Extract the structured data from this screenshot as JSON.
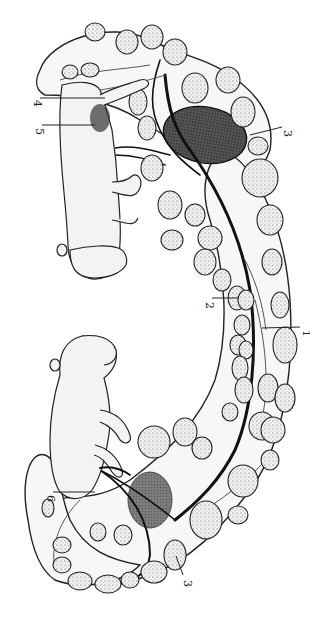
{
  "figure": {
    "colors": {
      "ink": "#222222",
      "background": "#ffffff",
      "shade": "#444444"
    },
    "labels": [
      {
        "id": "label-4-top",
        "text": "4",
        "x": 34,
        "y": 100
      },
      {
        "id": "label-5-top",
        "text": "5",
        "x": 36,
        "y": 128
      },
      {
        "id": "label-3-top",
        "text": "3",
        "x": 284,
        "y": 130
      },
      {
        "id": "label-2-middle",
        "text": "2",
        "x": 206,
        "y": 302
      },
      {
        "id": "label-1-middle",
        "text": "1",
        "x": 303,
        "y": 330
      },
      {
        "id": "label-6-bottom",
        "text": "6",
        "x": 47,
        "y": 495
      },
      {
        "id": "label-3-bottom",
        "text": "3",
        "x": 184,
        "y": 580
      }
    ],
    "fetuses": [
      {
        "name": "upper-fetus",
        "orientation": "head-down"
      },
      {
        "name": "lower-fetus",
        "orientation": "head-up"
      }
    ]
  }
}
